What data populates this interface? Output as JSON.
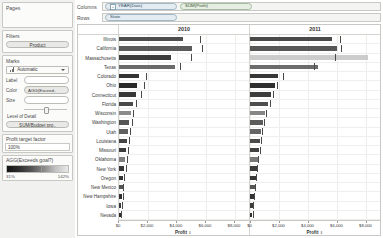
{
  "sidebar": {
    "pages": {
      "title": "Pages"
    },
    "filters": {
      "title": "Filters",
      "items": [
        "Product"
      ]
    },
    "marks": {
      "title": "Marks",
      "mark_type": "Automatic",
      "mark_type_icon": "bar-chart-icon",
      "dropdown_icon": "chevron-down-icon",
      "rows": [
        {
          "label": "Label",
          "value": ""
        },
        {
          "label": "Color",
          "value": "AGG(Exceed.."
        },
        {
          "label": "Size",
          "value": ""
        }
      ],
      "level_of_detail_title": "Level of Detail",
      "level_of_detail_item": "SUM(Budget pro.."
    },
    "profit_target": {
      "title": "Profit target factor",
      "value": "100%"
    },
    "legend": {
      "title": "AGG(Exceeds goal?)",
      "min": "31%",
      "max": "142%",
      "gradient_from": "#141414",
      "gradient_to": "#e9e9e9"
    }
  },
  "shelves": {
    "columns_label": "Columns",
    "rows_label": "Rows",
    "columns_pills": [
      {
        "text": "YEAR(Date)",
        "type": "blue",
        "expand_icon": "plus-box-icon"
      },
      {
        "text": "SUM(Profit)",
        "type": "green",
        "expand_icon": ""
      }
    ],
    "rows_pills": [
      {
        "text": "State",
        "type": "blue",
        "expand_icon": ""
      }
    ]
  },
  "chart_data": {
    "type": "bar",
    "title": "",
    "xlabel": "Profit",
    "ylabel": "State",
    "sort_indicator": "descending-sort-icon",
    "grid": true,
    "legend_position": "left-sidebar",
    "xlim": [
      0,
      9000
    ],
    "xticks": [
      0,
      2000,
      4000,
      6000,
      8000
    ],
    "xtick_labels": [
      "$0",
      "$2,000",
      "$4,000",
      "$6,000",
      "$8,000"
    ],
    "panel_headers": [
      "2010",
      "2011"
    ],
    "categories": [
      "Illinois",
      "California",
      "Massachusetts",
      "Texas",
      "Colorado",
      "Ohio",
      "Connecticut",
      "Florida",
      "Wisconsin",
      "Washington",
      "Utah",
      "Louisiana",
      "Missouri",
      "Oklahoma",
      "New York",
      "Oregon",
      "New Mexico",
      "New Hampshire",
      "Iowa",
      "Nevada"
    ],
    "series": [
      {
        "name": "2010",
        "values": [
          4450,
          5050,
          3600,
          3900,
          1350,
          1250,
          1150,
          950,
          800,
          700,
          620,
          560,
          500,
          430,
          360,
          300,
          250,
          200,
          160,
          120
        ],
        "reference_values": [
          5600,
          5750,
          5000,
          4250,
          1850,
          1700,
          1550,
          1150,
          1000,
          900,
          780,
          700,
          620,
          540,
          460,
          380,
          310,
          250,
          200,
          150
        ],
        "color_values": [
          0.82,
          0.88,
          0.74,
          0.95,
          0.7,
          0.66,
          0.72,
          0.8,
          1.1,
          0.85,
          0.9,
          0.78,
          0.74,
          1.05,
          0.72,
          0.7,
          0.85,
          0.68,
          0.72,
          0.66
        ]
      },
      {
        "name": "2011",
        "values": [
          5700,
          6000,
          8200,
          4700,
          1950,
          1700,
          1450,
          1250,
          1050,
          900,
          780,
          700,
          610,
          530,
          460,
          390,
          320,
          260,
          210,
          170
        ],
        "reference_values": [
          6250,
          6300,
          5900,
          4400,
          2250,
          1900,
          1600,
          1350,
          1120,
          960,
          840,
          760,
          660,
          570,
          490,
          420,
          350,
          280,
          230,
          180
        ],
        "color_values": [
          0.8,
          0.86,
          1.4,
          0.96,
          0.72,
          0.68,
          0.74,
          0.82,
          1.08,
          0.88,
          0.92,
          0.8,
          0.76,
          1.02,
          0.74,
          0.72,
          0.86,
          0.7,
          0.74,
          0.68
        ]
      }
    ]
  }
}
